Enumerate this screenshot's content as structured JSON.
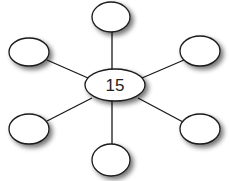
{
  "diagram": {
    "type": "spider-map",
    "center": {
      "label": "15",
      "cx": 115,
      "cy": 85,
      "rx": 30,
      "ry": 16
    },
    "satellites": [
      {
        "position": "top",
        "label": "",
        "cx": 111,
        "cy": 17
      },
      {
        "position": "top-left",
        "label": "",
        "cx": 29,
        "cy": 52
      },
      {
        "position": "top-right",
        "label": "",
        "cx": 200,
        "cy": 51
      },
      {
        "position": "bottom-left",
        "label": "",
        "cx": 29,
        "cy": 129
      },
      {
        "position": "bottom-right",
        "label": "",
        "cx": 200,
        "cy": 129
      },
      {
        "position": "bottom",
        "label": "",
        "cx": 111,
        "cy": 160
      }
    ],
    "colors": {
      "stroke": "#1a1a1a",
      "fill": "#ffffff",
      "shadow": "#9a9a9a"
    }
  }
}
